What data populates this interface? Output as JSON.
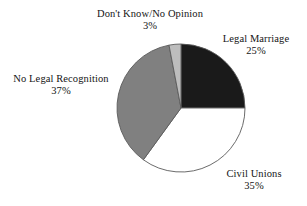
{
  "chart_data": {
    "type": "pie",
    "title": "",
    "subtitle": "",
    "xlabel": "",
    "ylabel": "",
    "legend_position": "none",
    "grid": false,
    "labels_outside": true,
    "start_angle_deg": 0,
    "direction": "clockwise",
    "categories": [
      "Legal Marriage",
      "Civil Unions",
      "No Legal Recognition",
      "Don't Know/No Opinion"
    ],
    "values": [
      25,
      35,
      37,
      3
    ],
    "value_labels": [
      "25%",
      "35%",
      "37%",
      "3%"
    ],
    "units": "percent",
    "total": 100,
    "colors": [
      "#1a1a1a",
      "#ffffff",
      "#808080",
      "#bdbdbd"
    ],
    "slice_outline_color": "#5a5a5a",
    "slices": [
      {
        "name": "Legal Marriage",
        "value": 25,
        "value_label": "25%",
        "color": "#1a1a1a",
        "start_angle_deg": 0,
        "end_angle_deg": 90
      },
      {
        "name": "Civil Unions",
        "value": 35,
        "value_label": "35%",
        "color": "#ffffff",
        "start_angle_deg": 90,
        "end_angle_deg": 216
      },
      {
        "name": "No Legal Recognition",
        "value": 37,
        "value_label": "37%",
        "color": "#808080",
        "start_angle_deg": 216,
        "end_angle_deg": 349.2
      },
      {
        "name": "Don't Know/No Opinion",
        "value": 3,
        "value_label": "3%",
        "color": "#bdbdbd",
        "start_angle_deg": 349.2,
        "end_angle_deg": 360
      }
    ]
  },
  "figure": {
    "background": "#ffffff",
    "text_color": "#141414",
    "center_x": 181,
    "center_y": 108,
    "radius": 64
  }
}
